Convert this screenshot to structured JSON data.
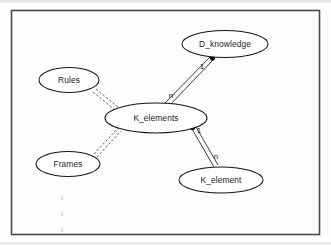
{
  "diagram": {
    "border_color": "#4a4a4a",
    "background_color": "#fdfdfc",
    "line_color": "#1c1c1c",
    "nodes": [
      {
        "id": "d_knowledge",
        "label": "D_knowledge",
        "cx": 225,
        "cy": 44,
        "rx": 43,
        "ry": 13.5
      },
      {
        "id": "rules",
        "label": "Rules",
        "cx": 69,
        "cy": 80,
        "rx": 30,
        "ry": 12.5
      },
      {
        "id": "k_elements",
        "label": "K_elements",
        "cx": 156,
        "cy": 118,
        "rx": 51,
        "ry": 15
      },
      {
        "id": "frames",
        "label": "Frames",
        "cx": 68,
        "cy": 164,
        "rx": 32,
        "ry": 12.5
      },
      {
        "id": "k_element",
        "label": "K_element",
        "cx": 221,
        "cy": 180,
        "rx": 42,
        "ry": 13
      }
    ],
    "edges": [
      {
        "id": "k_elements-to-d_knowledge",
        "from": "k_elements",
        "to": "d_knowledge",
        "style": "solid",
        "source_label": "n",
        "target_label": "1",
        "source_label_x": 171,
        "source_label_y": 96,
        "target_label_x": 202,
        "target_label_y": 67,
        "dot_end": "target"
      },
      {
        "id": "k_elements-to-k_element",
        "from": "k_elements",
        "to": "k_element",
        "style": "solid",
        "source_label": "1",
        "target_label": "n",
        "source_label_x": 199,
        "source_label_y": 131,
        "target_label_x": 216,
        "target_label_y": 157,
        "dot_end": "source"
      },
      {
        "id": "rules-to-k_elements",
        "from": "rules",
        "to": "k_elements",
        "style": "dashed",
        "source_label": "",
        "target_label": "",
        "dot_end": "none"
      },
      {
        "id": "frames-to-k_elements",
        "from": "frames",
        "to": "k_elements",
        "style": "dashed",
        "source_label": "",
        "target_label": "",
        "dot_end": "none"
      }
    ]
  }
}
